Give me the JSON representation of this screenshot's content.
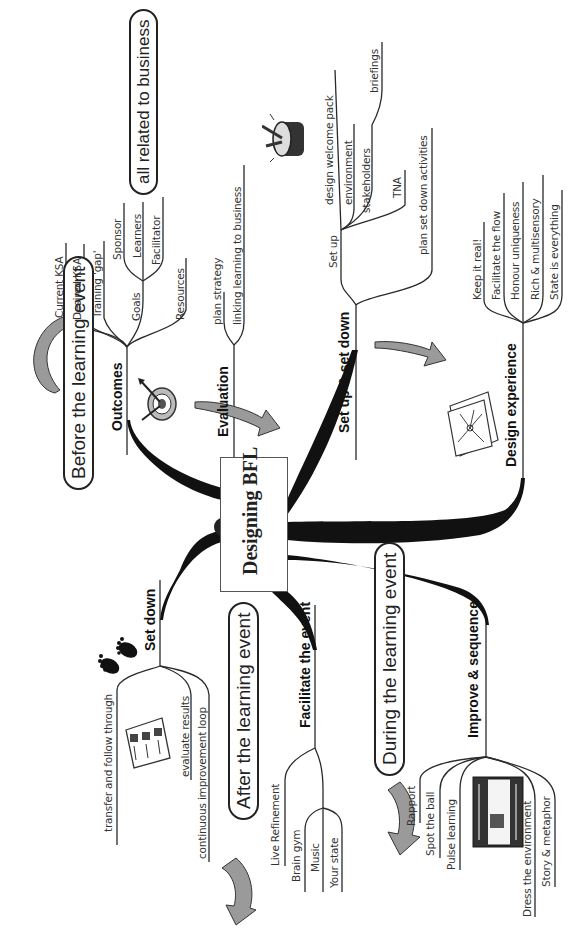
{
  "center": {
    "title": "Designing BFL"
  },
  "phases": {
    "before": "Before the learning event",
    "during": "During the learning event",
    "after": "After the learning event",
    "business_note": "all related to business"
  },
  "branches": {
    "outcomes": {
      "label": "Outcomes",
      "children": [
        "Current KSA",
        "Desired KSA",
        "Training 'gap'",
        "Goals",
        "Resources"
      ],
      "goals_children": [
        "Sponsor",
        "Learners",
        "Facilitator"
      ]
    },
    "evaluation": {
      "label": "Evaluation",
      "children": [
        "plan strategy",
        "linking learning to business"
      ]
    },
    "setup_setdown": {
      "label": "Set up & set down",
      "setup_label": "Set up",
      "setup_children": [
        "design welcome pack",
        "environment",
        "stakeholders",
        "briefings",
        "TNA"
      ],
      "other_children": [
        "plan set down activities"
      ]
    },
    "design_experience": {
      "label": "Design experience",
      "children": [
        "Keep it real!",
        "Facilitate the flow",
        "Honour uniqueness",
        "Rich & multisensory",
        "State is everything"
      ]
    },
    "improve_sequence": {
      "label": "Improve & sequence",
      "children": [
        "Rapport",
        "Spot the ball",
        "Pulse learning",
        "Dress the environment",
        "Story & metaphor"
      ]
    },
    "facilitate": {
      "label": "Facilitate the event",
      "children": [
        "Live Refinement",
        "Brain gym",
        "Music",
        "Your state"
      ]
    },
    "set_down": {
      "label": "Set down",
      "children": [
        "transfer and follow through",
        "evaluate results",
        "continuous improvement loop"
      ]
    }
  },
  "icons": [
    "target-arrows-icon",
    "drum-icon",
    "mindmap-sheet-icon",
    "classroom-icon",
    "footprints-icon",
    "checklist-icon",
    "curved-arrow-icon"
  ],
  "colors": {
    "ink": "#1a1a1a",
    "arrow_fill": "#9a9a9a",
    "background": "#ffffff"
  }
}
